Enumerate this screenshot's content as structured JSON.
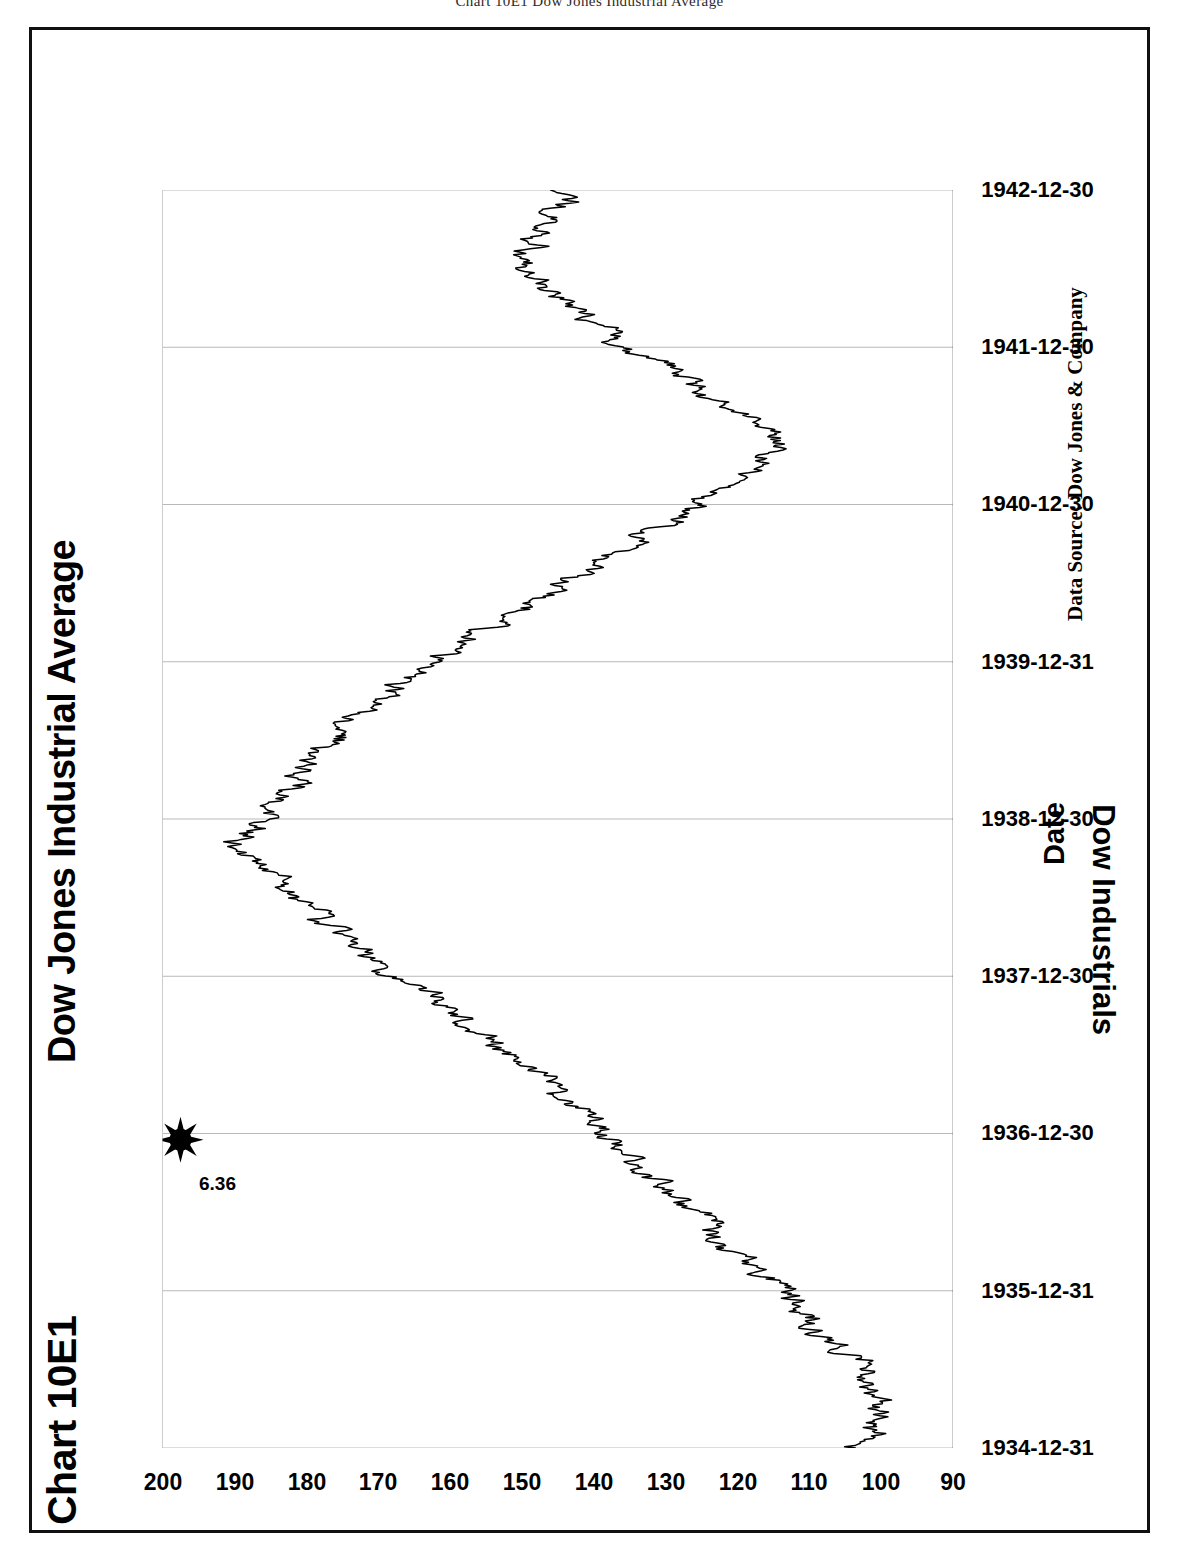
{
  "page_header": "Chart 10E1  Dow Jones Industrial Average",
  "frame": {
    "border_color": "#111111",
    "background": "#ffffff"
  },
  "labels": {
    "chart_number": "Chart 10E1",
    "source_note": "Data Source:  Dow Jones & Company"
  },
  "annotation": {
    "value_label": "6.36",
    "marker": "star-burst-8-point",
    "marker_color": "#000000"
  },
  "chart_data": {
    "type": "line",
    "title": "Dow Jones Industrial Average",
    "xlabel": "Date",
    "ylabel": "Dow Industrials",
    "orientation": "rotated-90-landscape-print",
    "grid": {
      "vertical": true,
      "horizontal": false,
      "color": "#b9b9b9"
    },
    "legend": "none",
    "line_color": "#000000",
    "ylim": [
      90,
      200
    ],
    "yticks": [
      200,
      190,
      180,
      170,
      160,
      150,
      140,
      130,
      120,
      110,
      100,
      90
    ],
    "xticks": [
      "1934-12-31",
      "1935-12-31",
      "1936-12-30",
      "1937-12-30",
      "1938-12-30",
      "1939-12-31",
      "1940-12-30",
      "1941-12-30",
      "1942-12-30"
    ],
    "x": [
      0.0,
      0.02,
      0.04,
      0.06,
      0.08,
      0.1,
      0.12,
      0.14,
      0.16,
      0.18,
      0.2,
      0.22,
      0.24,
      0.26,
      0.28,
      0.3,
      0.32,
      0.34,
      0.36,
      0.38,
      0.4,
      0.42,
      0.44,
      0.46,
      0.48,
      0.5,
      0.52,
      0.54,
      0.56,
      0.58,
      0.6,
      0.62,
      0.64,
      0.66,
      0.68,
      0.7,
      0.72,
      0.74,
      0.76,
      0.78,
      0.8,
      0.82,
      0.84,
      0.86,
      0.88,
      0.9,
      0.92,
      0.94,
      0.96,
      0.98,
      1.0
    ],
    "values": [
      104,
      101,
      99,
      103,
      106,
      110,
      113,
      117,
      121,
      124,
      128,
      133,
      136,
      140,
      144,
      149,
      153,
      158,
      163,
      168,
      172,
      177,
      182,
      186,
      190,
      186,
      183,
      180,
      176,
      172,
      168,
      163,
      158,
      152,
      146,
      140,
      134,
      128,
      122,
      118,
      115,
      119,
      124,
      130,
      136,
      142,
      147,
      150,
      148,
      145,
      142
    ],
    "series_note": "Daily closes, Dec 1934 - Dec 1942",
    "peak": {
      "value": 194,
      "approx_date": "1937-03"
    },
    "trough": {
      "value": 93,
      "approx_date": "1942-04"
    }
  }
}
